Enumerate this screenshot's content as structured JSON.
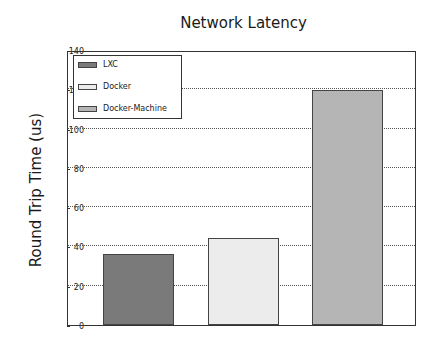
{
  "chart_data": {
    "type": "bar",
    "title": "Network Latency",
    "xlabel": "",
    "ylabel": "Round Trip Time (us)",
    "categories": [
      "LXC",
      "Docker",
      "Docker-Machine"
    ],
    "values": [
      36,
      44.5,
      119.5
    ],
    "colors": [
      "#7a7a7a",
      "#ececec",
      "#b5b5b5"
    ],
    "ylim": [
      0,
      140
    ],
    "yticks": [
      0,
      20,
      40,
      60,
      80,
      100,
      120,
      140
    ],
    "grid": true,
    "legend": {
      "position": "upper left",
      "entries": [
        "LXC",
        "Docker",
        "Docker-Machine"
      ]
    }
  }
}
